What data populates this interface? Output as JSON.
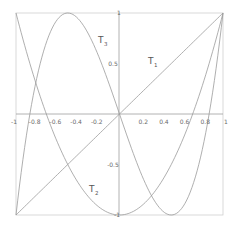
{
  "chart_data": {
    "type": "line",
    "title": "",
    "xlabel": "",
    "ylabel": "",
    "xlim": [
      -1,
      1
    ],
    "ylim": [
      -1,
      1
    ],
    "grid": false,
    "frame": true,
    "x_ticks": [
      "-1",
      "-0.8",
      "-0.6",
      "-0.4",
      "-0.2",
      "0.2",
      "0.4",
      "0.6",
      "0.8",
      "1"
    ],
    "y_ticks": [
      "1",
      "0.5",
      "-0.5",
      "-1"
    ],
    "series": [
      {
        "name": "T1",
        "label_main": "T",
        "label_sub": "1",
        "formula": "x",
        "x": [
          -1,
          -0.5,
          0,
          0.5,
          1
        ],
        "values": [
          -1,
          -0.5,
          0,
          0.5,
          1
        ]
      },
      {
        "name": "T2",
        "label_main": "T",
        "label_sub": "2",
        "formula": "2x^2 - 1",
        "x": [
          -1,
          -0.75,
          -0.5,
          -0.25,
          0,
          0.25,
          0.5,
          0.75,
          1
        ],
        "values": [
          1,
          0.125,
          -0.5,
          -0.875,
          -1,
          -0.875,
          -0.5,
          0.125,
          1
        ]
      },
      {
        "name": "T3",
        "label_main": "T",
        "label_sub": "3",
        "formula": "4x^3 - 3x",
        "x": [
          -1,
          -0.75,
          -0.5,
          -0.25,
          0,
          0.25,
          0.5,
          0.75,
          1
        ],
        "values": [
          -1,
          0.5625,
          1,
          0.6875,
          0,
          -0.6875,
          -1,
          -0.5625,
          1
        ]
      }
    ],
    "colors": {
      "axis": "#9a9a9a",
      "frame": "#c4c4c4",
      "curve": "#9a9a9a",
      "text": "#6a6a6a"
    }
  }
}
